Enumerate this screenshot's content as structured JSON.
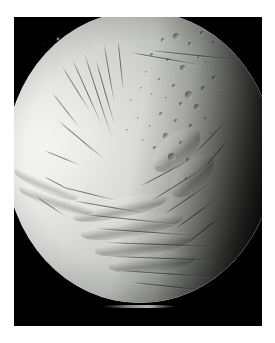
{
  "image": {
    "subject": "icy moon",
    "scene": "planetary body photographed against black space",
    "frame": {
      "canvas_width": 275,
      "canvas_height": 343,
      "border_color": "#ffffff",
      "plate_color": "#000000",
      "plate_x": 14,
      "plate_y": 17,
      "plate_width": 248,
      "plate_height": 309
    },
    "colors": {
      "space_black": "#000000",
      "bright_limb": "#f2f2f0",
      "mid_surface": "#bdbfba",
      "shadow_terrain": "#54574f",
      "terminator_black": "#101110",
      "page_white": "#ffffff",
      "star_speck": "#9aa0a6"
    },
    "disk": {
      "label": "moon-disk",
      "center_x": 140,
      "center_y": 157,
      "width": 268,
      "height": 292,
      "illumination": "lit from the left, terminator on the right"
    },
    "features": {
      "star_speck": {
        "label": "background-speck",
        "x": 57,
        "y": 38
      },
      "limb_streak": {
        "label": "bright-limb-highlight",
        "x": 100,
        "y": 305
      },
      "terrain_regions": [
        {
          "name": "smooth-bright-plains",
          "location": "left limb"
        },
        {
          "name": "fractured-grooved-terrain",
          "location": "upper center"
        },
        {
          "name": "cratered-terrain",
          "location": "upper right"
        },
        {
          "name": "ridged-plains",
          "location": "lower center"
        },
        {
          "name": "grooved-bands",
          "location": "lower right, in shadow"
        }
      ]
    },
    "craters": [
      {
        "x": 176,
        "y": 36,
        "d": 7.0
      },
      {
        "x": 190,
        "y": 44,
        "d": 4.2
      },
      {
        "x": 163,
        "y": 40,
        "d": 3.2
      },
      {
        "x": 202,
        "y": 33,
        "d": 3.6
      },
      {
        "x": 213,
        "y": 42,
        "d": 3.0
      },
      {
        "x": 152,
        "y": 55,
        "d": 3.4
      },
      {
        "x": 168,
        "y": 60,
        "d": 4.6
      },
      {
        "x": 183,
        "y": 68,
        "d": 6.4
      },
      {
        "x": 198,
        "y": 57,
        "d": 3.0
      },
      {
        "x": 146,
        "y": 72,
        "d": 2.6
      },
      {
        "x": 159,
        "y": 79,
        "d": 3.0
      },
      {
        "x": 174,
        "y": 86,
        "d": 3.4
      },
      {
        "x": 189,
        "y": 95,
        "d": 8.2
      },
      {
        "x": 203,
        "y": 88,
        "d": 5.0
      },
      {
        "x": 214,
        "y": 78,
        "d": 3.4
      },
      {
        "x": 197,
        "y": 107,
        "d": 5.6
      },
      {
        "x": 181,
        "y": 104,
        "d": 3.2
      },
      {
        "x": 166,
        "y": 98,
        "d": 2.6
      },
      {
        "x": 152,
        "y": 94,
        "d": 2.4
      },
      {
        "x": 141,
        "y": 88,
        "d": 2.2
      },
      {
        "x": 161,
        "y": 114,
        "d": 3.8
      },
      {
        "x": 176,
        "y": 121,
        "d": 4.4
      },
      {
        "x": 191,
        "y": 126,
        "d": 3.4
      },
      {
        "x": 205,
        "y": 118,
        "d": 3.0
      },
      {
        "x": 150,
        "y": 126,
        "d": 2.8
      },
      {
        "x": 138,
        "y": 118,
        "d": 2.4
      },
      {
        "x": 166,
        "y": 136,
        "d": 5.2
      },
      {
        "x": 181,
        "y": 143,
        "d": 4.0
      },
      {
        "x": 196,
        "y": 138,
        "d": 2.8
      },
      {
        "x": 155,
        "y": 148,
        "d": 3.2
      },
      {
        "x": 143,
        "y": 140,
        "d": 2.4
      },
      {
        "x": 172,
        "y": 157,
        "d": 7.6
      },
      {
        "x": 188,
        "y": 160,
        "d": 3.2
      },
      {
        "x": 131,
        "y": 100,
        "d": 2.0
      },
      {
        "x": 127,
        "y": 130,
        "d": 2.0
      },
      {
        "x": 206,
        "y": 62,
        "d": 2.6
      },
      {
        "x": 219,
        "y": 96,
        "d": 2.8
      },
      {
        "x": 211,
        "y": 133,
        "d": 2.6
      },
      {
        "x": 158,
        "y": 168,
        "d": 2.6
      },
      {
        "x": 186,
        "y": 178,
        "d": 3.0
      }
    ],
    "fractures": [
      {
        "x": 62,
        "y": 66,
        "len": 54,
        "rot": 58
      },
      {
        "x": 72,
        "y": 58,
        "len": 74,
        "rot": 66
      },
      {
        "x": 84,
        "y": 52,
        "len": 90,
        "rot": 72
      },
      {
        "x": 96,
        "y": 60,
        "len": 68,
        "rot": 74
      },
      {
        "x": 52,
        "y": 92,
        "len": 46,
        "rot": 52
      },
      {
        "x": 58,
        "y": 120,
        "len": 62,
        "rot": 40
      },
      {
        "x": 44,
        "y": 150,
        "len": 40,
        "rot": 22
      },
      {
        "x": 104,
        "y": 44,
        "len": 60,
        "rot": 80
      },
      {
        "x": 118,
        "y": 40,
        "len": 52,
        "rot": 84
      },
      {
        "x": 130,
        "y": 52,
        "len": 72,
        "rot": 10
      },
      {
        "x": 150,
        "y": 50,
        "len": 86,
        "rot": 6
      },
      {
        "x": 60,
        "y": 186,
        "len": 58,
        "rot": 14
      },
      {
        "x": 72,
        "y": 200,
        "len": 74,
        "rot": 10
      },
      {
        "x": 84,
        "y": 214,
        "len": 92,
        "rot": 6
      },
      {
        "x": 96,
        "y": 228,
        "len": 104,
        "rot": 4
      },
      {
        "x": 104,
        "y": 242,
        "len": 112,
        "rot": 2
      },
      {
        "x": 112,
        "y": 256,
        "len": 104,
        "rot": 2
      },
      {
        "x": 120,
        "y": 270,
        "len": 90,
        "rot": 4
      },
      {
        "x": 132,
        "y": 282,
        "len": 70,
        "rot": 6
      },
      {
        "x": 36,
        "y": 196,
        "len": 36,
        "rot": 34
      },
      {
        "x": 44,
        "y": 176,
        "len": 32,
        "rot": 28
      },
      {
        "x": 140,
        "y": 186,
        "len": 60,
        "rot": -28
      },
      {
        "x": 152,
        "y": 200,
        "len": 62,
        "rot": -32
      },
      {
        "x": 164,
        "y": 214,
        "len": 58,
        "rot": -34
      },
      {
        "x": 176,
        "y": 228,
        "len": 52,
        "rot": -36
      },
      {
        "x": 188,
        "y": 242,
        "len": 46,
        "rot": -38
      },
      {
        "x": 196,
        "y": 152,
        "len": 44,
        "rot": -46
      },
      {
        "x": 204,
        "y": 168,
        "len": 40,
        "rot": -50
      }
    ],
    "ridges": [
      {
        "x": 120,
        "y": 208,
        "w": 96,
        "h": 20,
        "rot": -12
      },
      {
        "x": 132,
        "y": 226,
        "w": 104,
        "h": 22,
        "rot": -10
      },
      {
        "x": 144,
        "y": 244,
        "w": 100,
        "h": 22,
        "rot": -8
      },
      {
        "x": 152,
        "y": 262,
        "w": 88,
        "h": 20,
        "rot": -6
      },
      {
        "x": 46,
        "y": 184,
        "w": 70,
        "h": 16,
        "rot": 24
      },
      {
        "x": 56,
        "y": 200,
        "w": 78,
        "h": 16,
        "rot": 18
      },
      {
        "x": 176,
        "y": 150,
        "w": 58,
        "h": 30,
        "rot": -40
      },
      {
        "x": 192,
        "y": 176,
        "w": 54,
        "h": 28,
        "rot": -44
      }
    ]
  }
}
